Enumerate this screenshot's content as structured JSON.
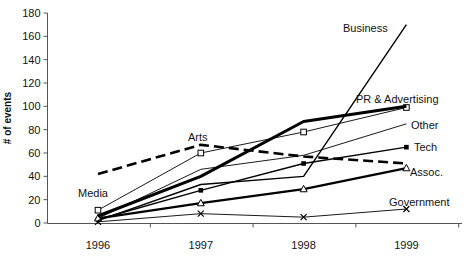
{
  "chart": {
    "ylabel": "# of events",
    "y_ticks": [
      0,
      20,
      40,
      60,
      80,
      100,
      120,
      140,
      160,
      180
    ],
    "x_labels": [
      "1996",
      "1997",
      "1998",
      "1999"
    ],
    "axis_color": "#555555",
    "line_color": "#000000"
  },
  "chart_data": {
    "type": "line",
    "x": [
      1996,
      1997,
      1998,
      1999
    ],
    "title": "",
    "xlabel": "",
    "ylabel": "# of events",
    "ylim": [
      0,
      180
    ],
    "ytick_step": 20,
    "grid": false,
    "legend_position": "inline-labels",
    "series": [
      {
        "name": "Media",
        "values": [
          11,
          60,
          78,
          99
        ],
        "marker": "open-square",
        "width": 0.9,
        "dash": null,
        "label": {
          "x": 78,
          "y": 197
        }
      },
      {
        "name": "Other",
        "values": [
          4,
          46,
          58,
          85
        ],
        "marker": "none",
        "width": 0.9,
        "dash": null,
        "label": {
          "x": 411,
          "y": 129
        }
      },
      {
        "name": "Government",
        "values": [
          1,
          8,
          5,
          12
        ],
        "marker": "x",
        "width": 0.9,
        "dash": null,
        "label": {
          "x": 389,
          "y": 206
        }
      },
      {
        "name": "Tech",
        "values": [
          3,
          28,
          51,
          65
        ],
        "marker": "filled-square",
        "width": 1.4,
        "dash": null,
        "label": {
          "x": 414,
          "y": 151
        }
      },
      {
        "name": "Assoc.",
        "values": [
          4,
          17,
          29,
          47
        ],
        "marker": "open-triangle",
        "width": 2.2,
        "dash": null,
        "label": {
          "x": 410,
          "y": 176
        }
      },
      {
        "name": "PR & Advertising",
        "values": [
          6,
          40,
          87,
          100
        ],
        "marker": "none",
        "width": 3.0,
        "dash": null,
        "label": {
          "x": 356,
          "y": 103
        }
      },
      {
        "name": "Arts",
        "values": [
          42,
          67,
          57,
          51
        ],
        "marker": "none",
        "width": 2.6,
        "dash": "10,5",
        "label": {
          "x": 188,
          "y": 141
        }
      },
      {
        "name": "Business",
        "values": [
          2,
          33,
          40,
          170
        ],
        "marker": "none",
        "width": 1.4,
        "dash": null,
        "label": {
          "x": 343,
          "y": 32
        }
      }
    ]
  }
}
